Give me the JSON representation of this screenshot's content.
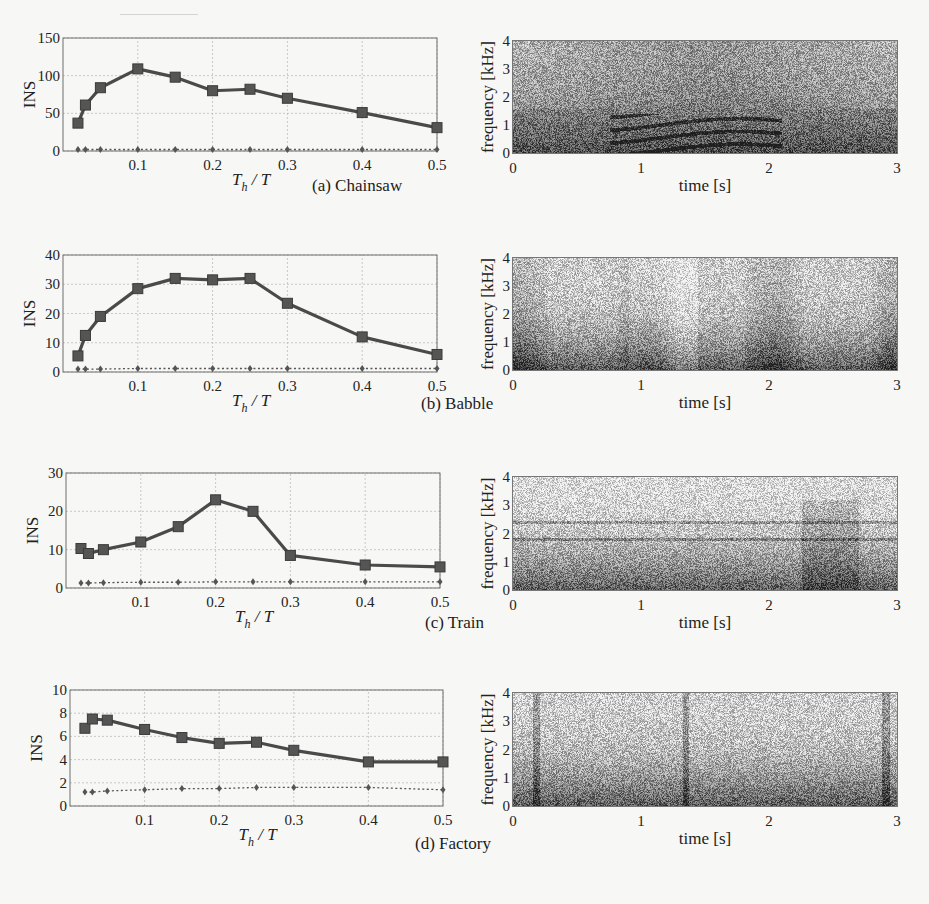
{
  "figure": {
    "panels": [
      {
        "id": "a",
        "caption": "(a) Chainsaw",
        "ins_plot": {
          "ylabel": "INS",
          "xlabel": "Th / T",
          "yticks": [
            "0",
            "50",
            "100",
            "150"
          ],
          "xticks": [
            "0.1",
            "0.2",
            "0.3",
            "0.4",
            "0.5"
          ]
        },
        "spectrogram": {
          "ylabel": "frequency [kHz]",
          "xlabel": "time [s]",
          "yticks": [
            "0",
            "1",
            "2",
            "3",
            "4"
          ],
          "xticks": [
            "0",
            "1",
            "2",
            "3"
          ]
        }
      },
      {
        "id": "b",
        "caption": "(b) Babble",
        "ins_plot": {
          "ylabel": "INS",
          "xlabel": "Th / T",
          "yticks": [
            "0",
            "10",
            "20",
            "30",
            "40"
          ],
          "xticks": [
            "0.1",
            "0.2",
            "0.3",
            "0.4",
            "0.5"
          ]
        },
        "spectrogram": {
          "ylabel": "frequency [kHz]",
          "xlabel": "time [s]",
          "yticks": [
            "0",
            "1",
            "2",
            "3",
            "4"
          ],
          "xticks": [
            "0",
            "1",
            "2",
            "3"
          ]
        }
      },
      {
        "id": "c",
        "caption": "(c) Train",
        "ins_plot": {
          "ylabel": "INS",
          "xlabel": "Th / T",
          "yticks": [
            "0",
            "10",
            "20",
            "30"
          ],
          "xticks": [
            "0.1",
            "0.2",
            "0.3",
            "0.4",
            "0.5"
          ]
        },
        "spectrogram": {
          "ylabel": "frequency [kHz]",
          "xlabel": "time [s]",
          "yticks": [
            "0",
            "1",
            "2",
            "3",
            "4"
          ],
          "xticks": [
            "0",
            "1",
            "2",
            "3"
          ]
        }
      },
      {
        "id": "d",
        "caption": "(d) Factory",
        "ins_plot": {
          "ylabel": "INS",
          "xlabel": "Th / T",
          "yticks": [
            "0",
            "2",
            "4",
            "6",
            "8",
            "10"
          ],
          "xticks": [
            "0.1",
            "0.2",
            "0.3",
            "0.4",
            "0.5"
          ]
        },
        "spectrogram": {
          "ylabel": "frequency [kHz]",
          "xlabel": "time [s]",
          "yticks": [
            "0",
            "1",
            "2",
            "3",
            "4"
          ],
          "xticks": [
            "0",
            "1",
            "2",
            "3"
          ]
        }
      }
    ]
  },
  "colors": {
    "line": "#4a4a4a",
    "grid": "#bdbdbd",
    "axis": "#6e6e6e",
    "text": "#222222"
  },
  "chart_data": [
    {
      "type": "line",
      "title": "(a) Chainsaw",
      "xlabel": "T_h / T",
      "ylabel": "INS",
      "x": [
        0.02,
        0.03,
        0.05,
        0.1,
        0.15,
        0.2,
        0.25,
        0.3,
        0.4,
        0.5
      ],
      "series": [
        {
          "name": "solid (square markers)",
          "values": [
            37,
            61,
            84,
            109,
            98,
            80,
            82,
            70,
            51,
            31
          ]
        },
        {
          "name": "dotted (diamond markers)",
          "values": [
            2,
            2,
            2,
            2,
            2,
            2,
            2,
            2,
            2,
            2
          ]
        }
      ],
      "xlim": [
        0,
        0.5
      ],
      "ylim": [
        0,
        150
      ],
      "grid": true
    },
    {
      "type": "line",
      "title": "(b) Babble",
      "xlabel": "T_h / T",
      "ylabel": "INS",
      "x": [
        0.02,
        0.03,
        0.05,
        0.1,
        0.15,
        0.2,
        0.25,
        0.3,
        0.4,
        0.5
      ],
      "series": [
        {
          "name": "solid (square markers)",
          "values": [
            5.5,
            12.5,
            19,
            28.5,
            32,
            31.5,
            32,
            23.5,
            12,
            6
          ]
        },
        {
          "name": "dotted (diamond markers)",
          "values": [
            1,
            1,
            1,
            1.2,
            1.2,
            1.2,
            1.2,
            1.2,
            1.2,
            1.2
          ]
        }
      ],
      "xlim": [
        0,
        0.5
      ],
      "ylim": [
        0,
        40
      ],
      "grid": true
    },
    {
      "type": "line",
      "title": "(c) Train",
      "xlabel": "T_h / T",
      "ylabel": "INS",
      "x": [
        0.02,
        0.03,
        0.05,
        0.1,
        0.15,
        0.2,
        0.25,
        0.3,
        0.4,
        0.5
      ],
      "series": [
        {
          "name": "solid (square markers)",
          "values": [
            10.3,
            9,
            10,
            12,
            16,
            23,
            20,
            8.5,
            6,
            5.5
          ]
        },
        {
          "name": "dotted (diamond markers)",
          "values": [
            1.3,
            1.3,
            1.4,
            1.5,
            1.5,
            1.6,
            1.6,
            1.6,
            1.6,
            1.6
          ]
        }
      ],
      "xlim": [
        0,
        0.5
      ],
      "ylim": [
        0,
        30
      ],
      "grid": true
    },
    {
      "type": "line",
      "title": "(d) Factory",
      "xlabel": "T_h / T",
      "ylabel": "INS",
      "x": [
        0.02,
        0.03,
        0.05,
        0.1,
        0.15,
        0.2,
        0.25,
        0.3,
        0.4,
        0.5
      ],
      "series": [
        {
          "name": "solid (square markers)",
          "values": [
            6.7,
            7.5,
            7.4,
            6.6,
            5.9,
            5.4,
            5.5,
            4.8,
            3.8,
            3.8
          ]
        },
        {
          "name": "dotted (diamond markers)",
          "values": [
            1.2,
            1.2,
            1.3,
            1.4,
            1.5,
            1.5,
            1.6,
            1.6,
            1.6,
            1.4
          ]
        }
      ],
      "xlim": [
        0,
        0.5
      ],
      "ylim": [
        0,
        10
      ],
      "grid": true
    }
  ],
  "layout": [
    {
      "plot": {
        "x0": 63,
        "x1": 437,
        "y0": 151,
        "y1": 38
      },
      "spec": {
        "x0": 513,
        "x1": 897,
        "y0": 153,
        "y1": 41
      },
      "caption": {
        "x": 312,
        "y": 176
      },
      "seed": 1,
      "style": "chainsaw"
    },
    {
      "plot": {
        "x0": 63,
        "x1": 437,
        "y0": 372,
        "y1": 255
      },
      "spec": {
        "x0": 513,
        "x1": 897,
        "y0": 370,
        "y1": 258
      },
      "caption": {
        "x": 421,
        "y": 394
      },
      "seed": 2,
      "style": "babble"
    },
    {
      "plot": {
        "x0": 66,
        "x1": 440,
        "y0": 588,
        "y1": 473
      },
      "spec": {
        "x0": 513,
        "x1": 897,
        "y0": 590,
        "y1": 477
      },
      "caption": {
        "x": 425,
        "y": 613
      },
      "seed": 3,
      "style": "train"
    },
    {
      "plot": {
        "x0": 70,
        "x1": 443,
        "y0": 806,
        "y1": 690
      },
      "spec": {
        "x0": 513,
        "x1": 897,
        "y0": 806,
        "y1": 693
      },
      "caption": {
        "x": 415,
        "y": 834
      },
      "seed": 4,
      "style": "factory"
    }
  ]
}
